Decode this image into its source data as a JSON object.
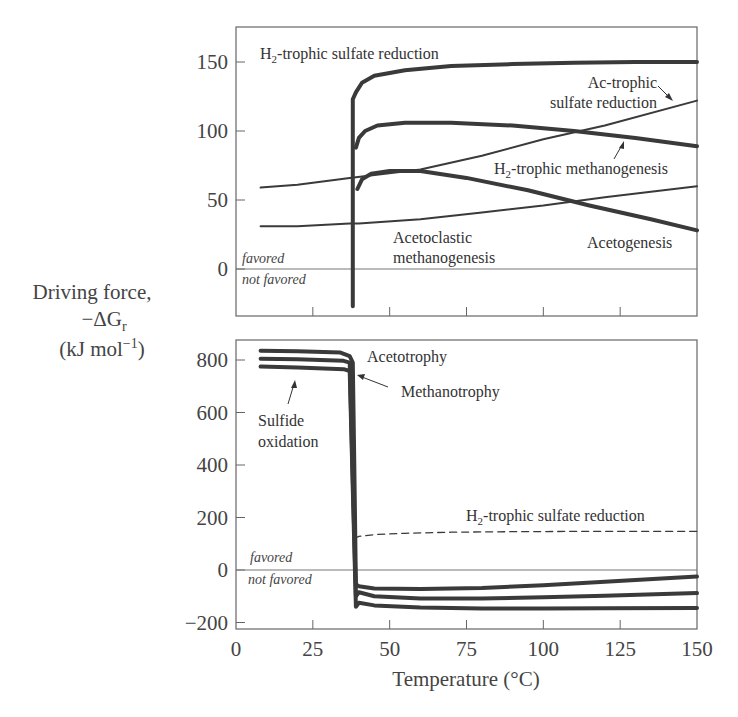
{
  "header_fragment": "...energy ... temperature ... product...",
  "y_axis_title": {
    "line1": "Driving force,",
    "line2": "−ΔG",
    "line2_sub": "r",
    "line3": "(kJ mol",
    "line3_sup": "−1",
    "line3_end": ")"
  },
  "x_axis_title": "Temperature (°C)",
  "zone_labels": {
    "favored": "favored",
    "not_favored": "not favored"
  },
  "chart_data": [
    {
      "type": "line",
      "panel": "top",
      "xlabel": "Temperature (°C)",
      "ylabel": "Driving force, −ΔGr (kJ mol−1)",
      "xlim": [
        0,
        150
      ],
      "ylim": [
        -35,
        175
      ],
      "x_ticks": [
        0,
        25,
        50,
        75,
        100,
        125,
        150
      ],
      "y_ticks": [
        0,
        50,
        100,
        150
      ],
      "y_tick_labels": [
        "0",
        "50",
        "100",
        "150"
      ],
      "grid": false,
      "zero_line": true,
      "series": [
        {
          "name": "H2-trophic sulfate reduction",
          "style": "thick",
          "x": [
            38,
            38,
            39,
            41,
            45,
            55,
            70,
            90,
            110,
            130,
            150
          ],
          "y": [
            -27,
            123,
            128,
            135,
            140,
            144,
            147,
            148.5,
            149.5,
            150,
            150
          ]
        },
        {
          "name": "H2-trophic methanogenesis",
          "style": "thick",
          "x": [
            39,
            40,
            42,
            46,
            55,
            70,
            90,
            110,
            130,
            150
          ],
          "y": [
            88,
            95,
            100,
            104,
            106,
            106,
            104,
            100,
            95,
            89
          ]
        },
        {
          "name": "Acetoclastic methanogenesis",
          "style": "thick",
          "x": [
            39.5,
            41,
            44,
            50,
            60,
            75,
            95,
            115,
            135,
            150
          ],
          "y": [
            58,
            65,
            69,
            71,
            71,
            66,
            57,
            46,
            36,
            28
          ]
        },
        {
          "name": "Ac-trophic sulfate reduction",
          "style": "thin",
          "x": [
            8,
            20,
            37,
            60,
            80,
            100,
            120,
            150
          ],
          "y": [
            59,
            61,
            66,
            72,
            82,
            94,
            104,
            122
          ]
        },
        {
          "name": "Acetogenesis",
          "style": "thin",
          "x": [
            8,
            20,
            37,
            40,
            60,
            80,
            100,
            120,
            150
          ],
          "y": [
            31,
            31,
            33,
            33,
            36,
            41,
            46,
            52,
            60
          ]
        }
      ],
      "annotations": [
        {
          "text": "H2-trophic sulfate reduction",
          "main": "H",
          "sub": "2",
          "rest": "-trophic sulfate reduction"
        },
        {
          "text": "Ac-trophic",
          "line": 1
        },
        {
          "text": "sulfate reduction",
          "line": 2
        },
        {
          "text": "H2-trophic methanogenesis",
          "main": "H",
          "sub": "2",
          "rest": "-trophic methanogenesis"
        },
        {
          "text": "Acetoclastic"
        },
        {
          "text": "methanogenesis"
        },
        {
          "text": "Acetogenesis"
        }
      ]
    },
    {
      "type": "line",
      "panel": "bottom",
      "xlabel": "Temperature (°C)",
      "ylabel": "Driving force, −ΔGr (kJ mol−1)",
      "xlim": [
        0,
        150
      ],
      "ylim": [
        -240,
        880
      ],
      "x_ticks": [
        0,
        25,
        50,
        75,
        100,
        125,
        150
      ],
      "x_tick_labels": [
        "0",
        "25",
        "50",
        "75",
        "100",
        "125",
        "150"
      ],
      "y_ticks": [
        -200,
        0,
        200,
        400,
        600,
        800
      ],
      "y_tick_labels": [
        "−200",
        "0",
        "200",
        "400",
        "600",
        "800"
      ],
      "grid": false,
      "zero_line": true,
      "series": [
        {
          "name": "Acetotrophy",
          "style": "thick",
          "x": [
            8,
            20,
            34,
            37,
            38,
            38.5,
            39,
            40,
            45,
            60,
            80,
            100,
            120,
            150
          ],
          "y": [
            835,
            833,
            828,
            815,
            790,
            400,
            -55,
            -62,
            -70,
            -72,
            -68,
            -58,
            -45,
            -25
          ]
        },
        {
          "name": "Methanotrophy",
          "style": "thick",
          "x": [
            8,
            20,
            35,
            37,
            39,
            40,
            45,
            60,
            80,
            100,
            120,
            150
          ],
          "y": [
            805,
            803,
            797,
            790,
            -100,
            -85,
            -100,
            -108,
            -108,
            -104,
            -98,
            -88
          ]
        },
        {
          "name": "Sulfide oxidation",
          "style": "thick",
          "x": [
            8,
            20,
            35,
            37,
            39,
            40,
            45,
            60,
            80,
            100,
            120,
            150
          ],
          "y": [
            775,
            772,
            765,
            758,
            -140,
            -125,
            -135,
            -143,
            -147,
            -147,
            -146,
            -145
          ]
        },
        {
          "name": "H2-trophic sulfate reduction",
          "style": "dashed",
          "x": [
            38.5,
            40,
            45,
            55,
            70,
            90,
            110,
            130,
            150
          ],
          "y": [
            120,
            128,
            135,
            140,
            144,
            146,
            147,
            147,
            147
          ]
        }
      ],
      "annotations": [
        {
          "text": "Acetotrophy"
        },
        {
          "text": "Methanotrophy"
        },
        {
          "text": "Sulfide",
          "line": 1
        },
        {
          "text": "oxidation",
          "line": 2
        },
        {
          "text": "H2-trophic sulfate reduction",
          "main": "H",
          "sub": "2",
          "rest": "-trophic sulfate reduction"
        }
      ]
    }
  ],
  "colors": {
    "curve": "#3a3a3a",
    "axis": "#555555",
    "text": "#444444"
  }
}
